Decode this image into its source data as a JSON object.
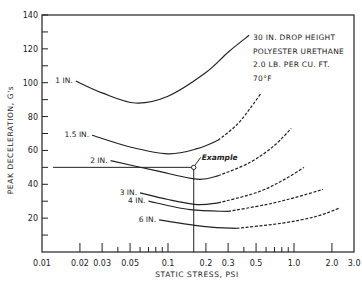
{
  "chart_data": {
    "type": "line",
    "title": "",
    "xlabel": "STATIC STRESS, PSI",
    "ylabel": "PEAK DECELERATION, G's",
    "xscale": "log",
    "xlim": [
      0.01,
      3.0
    ],
    "ylim": [
      0,
      140
    ],
    "x_tick_labels": [
      "0.01",
      "0.02",
      "0.03",
      "0.05",
      "0.1",
      "0.2",
      "0.3",
      "0.5",
      "1.0",
      "2.0",
      "3.0"
    ],
    "x_ticks": [
      0.01,
      0.02,
      0.03,
      0.05,
      0.1,
      0.2,
      0.3,
      0.5,
      1.0,
      2.0,
      3.0
    ],
    "x_minor_ticks": [
      0.04,
      0.06,
      0.07,
      0.08,
      0.09,
      0.4,
      0.6,
      0.7,
      0.8,
      0.9
    ],
    "y_ticks": [
      20,
      40,
      60,
      80,
      100,
      120,
      140
    ],
    "y_minor_ticks": [
      10,
      30,
      50,
      70,
      90,
      110,
      130
    ],
    "grid": false,
    "annotations": {
      "notes": [
        "30 IN. DROP HEIGHT",
        "POLYESTER URETHANE",
        "2.0 LB. PER CU. FT.",
        "70°F"
      ],
      "example": {
        "label": "Example",
        "x": 0.16,
        "y": 50
      }
    },
    "series": [
      {
        "name": "1 IN.",
        "solid": [
          [
            0.0185,
            101
          ],
          [
            0.03,
            94
          ],
          [
            0.055,
            88
          ],
          [
            0.1,
            92
          ],
          [
            0.2,
            106
          ],
          [
            0.3,
            118
          ],
          [
            0.44,
            128
          ]
        ],
        "dashed": []
      },
      {
        "name": "1.5 IN.",
        "solid": [
          [
            0.025,
            69
          ],
          [
            0.05,
            62
          ],
          [
            0.1,
            58
          ],
          [
            0.17,
            61
          ],
          [
            0.25,
            66
          ]
        ],
        "dashed": [
          [
            0.25,
            66
          ],
          [
            0.35,
            75
          ],
          [
            0.45,
            85
          ],
          [
            0.55,
            94
          ]
        ]
      },
      {
        "name": "2 IN.",
        "solid": [
          [
            0.035,
            54
          ],
          [
            0.08,
            48
          ],
          [
            0.17,
            43
          ],
          [
            0.25,
            45
          ]
        ],
        "dashed": [
          [
            0.25,
            45
          ],
          [
            0.45,
            53
          ],
          [
            0.7,
            63
          ],
          [
            0.95,
            73
          ]
        ]
      },
      {
        "name": "3 IN.",
        "solid": [
          [
            0.06,
            35
          ],
          [
            0.1,
            31
          ],
          [
            0.17,
            28
          ],
          [
            0.25,
            29
          ]
        ],
        "dashed": [
          [
            0.25,
            29
          ],
          [
            0.5,
            35
          ],
          [
            0.8,
            42
          ],
          [
            1.2,
            50
          ]
        ]
      },
      {
        "name": "4 IN.",
        "solid": [
          [
            0.07,
            30
          ],
          [
            0.15,
            25
          ],
          [
            0.3,
            24
          ]
        ],
        "dashed": [
          [
            0.3,
            24
          ],
          [
            0.6,
            28
          ],
          [
            1.0,
            32
          ],
          [
            1.7,
            37
          ]
        ]
      },
      {
        "name": "6 IN.",
        "solid": [
          [
            0.085,
            19
          ],
          [
            0.2,
            15
          ],
          [
            0.35,
            14
          ]
        ],
        "dashed": [
          [
            0.35,
            14
          ],
          [
            0.8,
            17
          ],
          [
            1.5,
            21
          ],
          [
            2.3,
            26
          ]
        ]
      }
    ]
  }
}
